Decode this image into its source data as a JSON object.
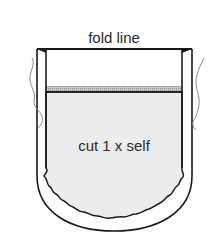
{
  "diagram": {
    "labels": {
      "fold_line": "fold line",
      "cut_instruction": "cut 1 x self"
    },
    "colors": {
      "stroke": "#1a1a1a",
      "fill": "#ececec",
      "band": "#9a9a9a",
      "background": "#ffffff",
      "squiggle": "#8a8a8a"
    }
  }
}
